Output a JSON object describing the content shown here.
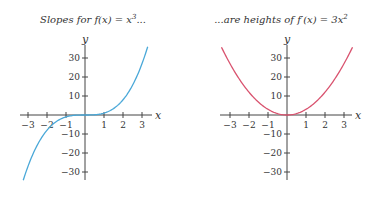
{
  "chart_data": [
    {
      "type": "line",
      "title": "Slopes for f(x) = x³...",
      "title_parts": {
        "prefix": "Slopes for ",
        "fn": "f",
        "arg": "(x) = x",
        "sup": "3",
        "suffix": "..."
      },
      "xlabel": "x",
      "ylabel": "y",
      "xlim": [
        -3.5,
        3.5
      ],
      "ylim": [
        -35,
        35
      ],
      "x_ticks": [
        -3,
        -2,
        -1,
        1,
        2,
        3
      ],
      "x_tick_labels": [
        "−3",
        "−2",
        "−1",
        "1",
        "2",
        "3"
      ],
      "y_ticks": [
        30,
        20,
        10,
        -10,
        -20,
        -30
      ],
      "y_tick_labels": [
        "30",
        "20",
        "10",
        "−10",
        "−20",
        "−30"
      ],
      "grid": false,
      "series": [
        {
          "name": "f(x) = x^3",
          "function": "x^3",
          "x_range": [
            -3.25,
            3.3
          ],
          "color": "#4aa8d8"
        }
      ]
    },
    {
      "type": "line",
      "title": "...are heights of f′(x) = 3x²",
      "title_parts": {
        "prefix": "...are heights of ",
        "fn": "f",
        "arg": "′(x) = 3x",
        "sup": "2",
        "suffix": ""
      },
      "xlabel": "x",
      "ylabel": "y",
      "xlim": [
        -3.5,
        3.5
      ],
      "ylim": [
        -35,
        35
      ],
      "x_ticks": [
        -3,
        -2,
        -1,
        1,
        2,
        3
      ],
      "x_tick_labels": [
        "−3",
        "−2",
        "−1",
        "1",
        "2",
        "3"
      ],
      "y_ticks": [
        30,
        20,
        10,
        -10,
        -20,
        -30
      ],
      "y_tick_labels": [
        "30",
        "20",
        "10",
        "−10",
        "−20",
        "−30"
      ],
      "grid": false,
      "series": [
        {
          "name": "f'(x) = 3x^2",
          "function": "3*x^2",
          "x_range": [
            -3.45,
            3.45
          ],
          "color": "#d9536f"
        }
      ]
    }
  ]
}
